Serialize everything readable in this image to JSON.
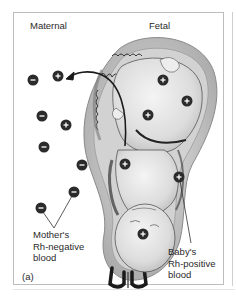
{
  "figure": {
    "panel_label": "(a)",
    "headers": {
      "maternal": "Maternal",
      "fetal": "Fetal"
    },
    "annotations": {
      "mother_blood": [
        "Mother's",
        "Rh-negative",
        "blood"
      ],
      "baby_blood": [
        "Baby's",
        "Rh-positive",
        "blood"
      ]
    },
    "symbols": {
      "negative": "−",
      "positive": "+"
    },
    "maternal_cells": [
      {
        "type": "negative",
        "x": 33,
        "y": 80
      },
      {
        "type": "positive",
        "x": 58,
        "y": 76
      },
      {
        "type": "negative",
        "x": 42,
        "y": 116
      },
      {
        "type": "positive",
        "x": 66,
        "y": 125
      },
      {
        "type": "negative",
        "x": 44,
        "y": 147
      },
      {
        "type": "negative",
        "x": 82,
        "y": 165
      },
      {
        "type": "negative",
        "x": 74,
        "y": 192
      },
      {
        "type": "negative",
        "x": 41,
        "y": 208
      }
    ],
    "fetal_cells": [
      {
        "type": "positive",
        "x": 163,
        "y": 80
      },
      {
        "type": "positive",
        "x": 187,
        "y": 101
      },
      {
        "type": "positive",
        "x": 148,
        "y": 115
      },
      {
        "type": "positive",
        "x": 125,
        "y": 164
      },
      {
        "type": "positive",
        "x": 179,
        "y": 177
      },
      {
        "type": "positive",
        "x": 143,
        "y": 234
      }
    ],
    "colors": {
      "cell_fill": "#2b2b2b",
      "uterus_wall": "#bfbfbf",
      "fetus_skin": "#e6e6e6",
      "line": "#333333",
      "frame": "#bdbdbd"
    }
  }
}
